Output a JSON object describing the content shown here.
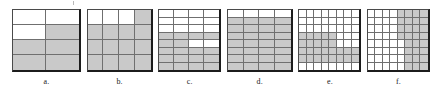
{
  "figure": {
    "title": "",
    "background_color": "#ffffff",
    "shade_color": "#c9c9c9",
    "blank_color": "#ffffff",
    "grid_line_color": "#6f6f6f",
    "border_color": "#1c1c1c"
  },
  "chart_data": {
    "type": "table",
    "title": "",
    "items": [
      {
        "id": "a",
        "label": "a.",
        "cols": 2,
        "rows": 4,
        "total_cells": 8,
        "shaded_count": 5,
        "fraction": "5/8",
        "cells": [
          [
            0,
            0
          ],
          [
            0,
            1
          ],
          [
            1,
            1
          ],
          [
            1,
            1
          ]
        ],
        "width_px": 66,
        "height_px": 60
      },
      {
        "id": "b",
        "label": "b.",
        "cols": 4,
        "rows": 4,
        "total_cells": 16,
        "shaded_count": 13,
        "fraction": "13/16",
        "cells": [
          [
            0,
            0,
            0,
            1
          ],
          [
            1,
            1,
            1,
            1
          ],
          [
            1,
            1,
            1,
            1
          ],
          [
            1,
            1,
            1,
            1
          ]
        ],
        "width_px": 63,
        "height_px": 60
      },
      {
        "id": "c",
        "label": "c.",
        "cols": 4,
        "rows": 8,
        "total_cells": 32,
        "shaded_count": 18,
        "fraction": "18/32",
        "cells": [
          [
            0,
            0,
            0,
            0
          ],
          [
            0,
            0,
            0,
            0
          ],
          [
            0,
            0,
            0,
            0
          ],
          [
            1,
            1,
            1,
            1
          ],
          [
            1,
            1,
            0,
            0
          ],
          [
            1,
            1,
            1,
            1
          ],
          [
            1,
            1,
            1,
            1
          ],
          [
            1,
            1,
            1,
            1
          ]
        ],
        "width_px": 60,
        "height_px": 60
      },
      {
        "id": "d",
        "label": "d.",
        "cols": 4,
        "rows": 8,
        "total_cells": 32,
        "shaded_count": 28,
        "fraction": "28/32",
        "cells": [
          [
            0,
            0,
            0,
            0
          ],
          [
            1,
            1,
            1,
            1
          ],
          [
            1,
            1,
            1,
            1
          ],
          [
            1,
            1,
            1,
            1
          ],
          [
            1,
            1,
            1,
            1
          ],
          [
            1,
            1,
            1,
            1
          ],
          [
            1,
            1,
            1,
            1
          ],
          [
            1,
            1,
            1,
            1
          ]
        ],
        "width_px": 63,
        "height_px": 60
      },
      {
        "id": "e",
        "label": "e.",
        "cols": 8,
        "rows": 8,
        "total_cells": 64,
        "shaded_count": 29,
        "fraction": "29/64",
        "cells": [
          [
            0,
            0,
            0,
            0,
            0,
            0,
            0,
            0
          ],
          [
            0,
            0,
            0,
            0,
            0,
            0,
            0,
            0
          ],
          [
            0,
            0,
            0,
            0,
            0,
            0,
            0,
            0
          ],
          [
            1,
            1,
            1,
            1,
            1,
            0,
            0,
            0
          ],
          [
            1,
            1,
            1,
            1,
            1,
            0,
            0,
            0
          ],
          [
            1,
            1,
            1,
            1,
            1,
            1,
            1,
            1
          ],
          [
            1,
            1,
            1,
            1,
            1,
            1,
            1,
            1
          ],
          [
            0,
            0,
            0,
            0,
            0,
            0,
            0,
            0
          ]
        ],
        "width_px": 60,
        "height_px": 60
      },
      {
        "id": "f",
        "label": "f.",
        "cols": 8,
        "rows": 8,
        "total_cells": 64,
        "shaded_count": 27,
        "fraction": "27/64",
        "cells": [
          [
            0,
            0,
            0,
            0,
            1,
            1,
            1,
            1
          ],
          [
            0,
            0,
            0,
            0,
            1,
            1,
            1,
            1
          ],
          [
            0,
            0,
            0,
            0,
            1,
            1,
            1,
            1
          ],
          [
            0,
            0,
            0,
            0,
            1,
            1,
            1,
            1
          ],
          [
            0,
            0,
            0,
            0,
            0,
            1,
            1,
            1
          ],
          [
            0,
            0,
            0,
            0,
            0,
            1,
            1,
            1
          ],
          [
            0,
            0,
            0,
            0,
            0,
            1,
            1,
            1
          ],
          [
            0,
            0,
            0,
            0,
            0,
            1,
            1,
            1
          ]
        ],
        "width_px": 60,
        "height_px": 60
      }
    ]
  }
}
